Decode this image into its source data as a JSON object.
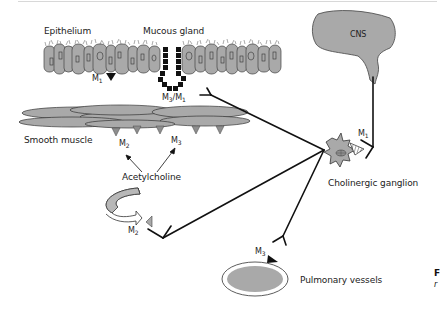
{
  "figure": {
    "labels": {
      "epithelium": "Epithelium",
      "mucous_gland": "Mucous gland",
      "cns": "CNS",
      "smooth_muscle": "Smooth muscle",
      "acetylcholine": "Acetylcholine",
      "cholinergic_ganglion": "Cholinergic ganglion",
      "pulmonary_vessels": "Pulmonary vessels"
    },
    "receptors": {
      "epithelium": {
        "base": "M",
        "sub": "1"
      },
      "gland": {
        "base": "M",
        "sub": "3",
        "sep": "/M",
        "sub2": "1"
      },
      "muscle_left": {
        "base": "M",
        "sub": "2"
      },
      "muscle_right": {
        "base": "M",
        "sub": "3"
      },
      "ganglion": {
        "base": "M",
        "sub": "1"
      },
      "nerve_terminal": {
        "base": "M",
        "sub": "2"
      },
      "vessels": {
        "base": "M",
        "sub": "3"
      }
    },
    "cutoff_text": {
      "bold": "F",
      "italic": "r"
    },
    "colors": {
      "tissue_fill": "#a9a9a9",
      "outline": "#333333",
      "nerve": "#111111",
      "gland_block": "#111111"
    }
  }
}
